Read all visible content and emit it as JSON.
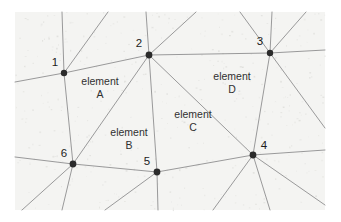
{
  "figure": {
    "background_color": "#f4f4f2",
    "page_color": "#ffffff",
    "edge_color": "#8e8e90",
    "node_color": "#2b2b2b",
    "label_color": "#303030",
    "width": 341,
    "height": 222
  },
  "canvas": {
    "x": 15,
    "y": 12,
    "width": 310,
    "height": 198
  },
  "nodes": [
    {
      "id": "1",
      "label": "1",
      "x": 64,
      "y": 73,
      "label_x": 55,
      "label_y": 66,
      "radius": 3.2
    },
    {
      "id": "2",
      "label": "2",
      "x": 149,
      "y": 55,
      "label_x": 139,
      "label_y": 47,
      "radius": 3.4
    },
    {
      "id": "3",
      "label": "3",
      "x": 270,
      "y": 53,
      "label_x": 260,
      "label_y": 45,
      "radius": 3.2
    },
    {
      "id": "4",
      "label": "4",
      "x": 253,
      "y": 155,
      "label_x": 264,
      "label_y": 149,
      "radius": 3.4
    },
    {
      "id": "5",
      "label": "5",
      "x": 157,
      "y": 172,
      "label_x": 147,
      "label_y": 165,
      "radius": 3.4
    },
    {
      "id": "6",
      "label": "6",
      "x": 73,
      "y": 164,
      "label_x": 64,
      "label_y": 157,
      "radius": 3.4
    }
  ],
  "interior_edges": [
    {
      "from": "1",
      "to": "2"
    },
    {
      "from": "2",
      "to": "3"
    },
    {
      "from": "2",
      "to": "5"
    },
    {
      "from": "2",
      "to": "6"
    },
    {
      "from": "2",
      "to": "4"
    },
    {
      "from": "3",
      "to": "4"
    },
    {
      "from": "4",
      "to": "5"
    },
    {
      "from": "5",
      "to": "6"
    },
    {
      "from": "6",
      "to": "1"
    }
  ],
  "boundary_edges": [
    {
      "from": "1",
      "x2": 15,
      "y2": 82
    },
    {
      "from": "1",
      "x2": 62,
      "y2": 12
    },
    {
      "from": "1",
      "x2": 108,
      "y2": 12
    },
    {
      "from": "2",
      "x2": 146,
      "y2": 12
    },
    {
      "from": "2",
      "x2": 196,
      "y2": 12
    },
    {
      "from": "3",
      "x2": 240,
      "y2": 12
    },
    {
      "from": "3",
      "x2": 272,
      "y2": 12
    },
    {
      "from": "3",
      "x2": 306,
      "y2": 12
    },
    {
      "from": "3",
      "x2": 325,
      "y2": 50
    },
    {
      "from": "3",
      "x2": 325,
      "y2": 128
    },
    {
      "from": "4",
      "x2": 325,
      "y2": 150
    },
    {
      "from": "4",
      "x2": 325,
      "y2": 205
    },
    {
      "from": "4",
      "x2": 270,
      "y2": 210
    },
    {
      "from": "4",
      "x2": 213,
      "y2": 210
    },
    {
      "from": "5",
      "x2": 158,
      "y2": 210
    },
    {
      "from": "5",
      "x2": 105,
      "y2": 210
    },
    {
      "from": "6",
      "x2": 15,
      "y2": 157
    },
    {
      "from": "6",
      "x2": 62,
      "y2": 210
    },
    {
      "from": "6",
      "x2": 22,
      "y2": 210
    }
  ],
  "element_labels": [
    {
      "id": "A",
      "line1": "element",
      "line2": "A",
      "x": 100,
      "y": 85
    },
    {
      "id": "B",
      "line1": "element",
      "line2": "B",
      "x": 129,
      "y": 136
    },
    {
      "id": "C",
      "line1": "element",
      "line2": "C",
      "x": 193,
      "y": 118
    },
    {
      "id": "D",
      "line1": "element",
      "line2": "D",
      "x": 232,
      "y": 80
    }
  ]
}
